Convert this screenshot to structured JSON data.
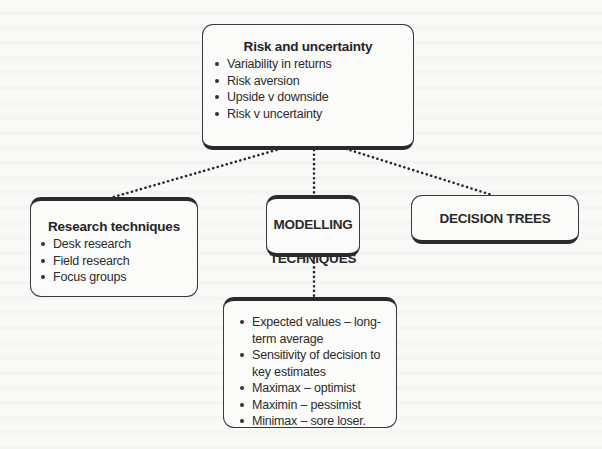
{
  "diagram": {
    "root": {
      "title": "Risk and uncertainty",
      "items": [
        "Variability in returns",
        "Risk aversion",
        "Upside v downside",
        "Risk v uncertainty"
      ]
    },
    "branches": {
      "research": {
        "title": "Research techniques",
        "items": [
          "Desk research",
          "Field research",
          "Focus groups"
        ]
      },
      "modelling": {
        "title_line1": "MODELLING",
        "title_line2": "TECHNIQUES"
      },
      "decision": {
        "title": "DECISION TREES"
      }
    },
    "modelling_methods": {
      "items": [
        "Expected values – long-term average",
        "Sensitivity of decision to key estimates",
        "Maximax – optimist",
        "Maximin – pessimist",
        "Minimax – sore loser."
      ]
    },
    "connectors": [
      {
        "from": "root",
        "to": "research",
        "style": "dotted"
      },
      {
        "from": "root",
        "to": "modelling",
        "style": "dotted"
      },
      {
        "from": "root",
        "to": "decision",
        "style": "dotted"
      },
      {
        "from": "modelling",
        "to": "modelling_methods",
        "style": "dotted"
      }
    ]
  },
  "colors": {
    "background": "#f9f9f8",
    "box_border": "#2a2a2a",
    "text": "#2a2a2a"
  }
}
